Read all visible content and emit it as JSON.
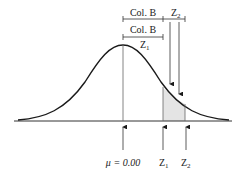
{
  "diagram": {
    "type": "normal-distribution",
    "labels": {
      "top_bracket_left": "Col. B",
      "top_bracket_right": "Z",
      "top_bracket_right_sub": "2",
      "second_bracket": "Col. B",
      "second_bracket_under": "Z",
      "second_bracket_under_sub": "1",
      "mean": "μ = 0.00",
      "z1": "Z",
      "z1_sub": "1",
      "z2": "Z",
      "z2_sub": "2"
    },
    "colors": {
      "curve": "#1a1a1a",
      "lines": "#555555",
      "shade": "#e4e4e4"
    }
  }
}
